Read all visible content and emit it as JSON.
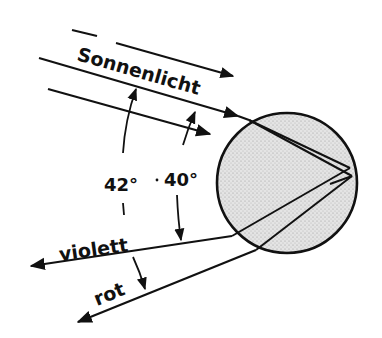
{
  "diagram": {
    "labels": {
      "sunlight": "Sonnenlicht",
      "angle_red": "42°",
      "angle_violet": "40°",
      "violet": "violett",
      "red": "rot"
    },
    "colors": {
      "ink": "#111111",
      "droplet_fill": "#d9d9d9",
      "background": "#ffffff"
    },
    "droplet": {
      "cx": 287,
      "cy": 183,
      "r": 70
    }
  }
}
